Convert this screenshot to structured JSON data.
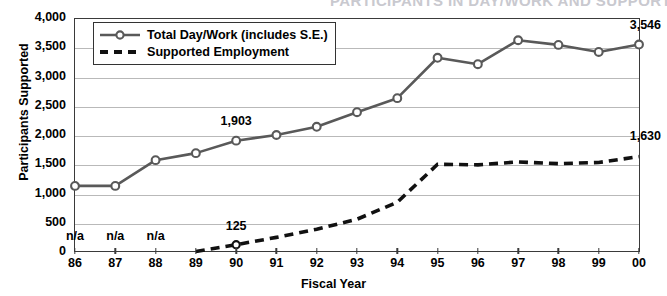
{
  "chart_data": {
    "type": "line",
    "title": "PARTICIPANTS IN DAY/WORK AND SUPPORTED EMPLOYMENT",
    "xlabel": "Fiscal Year",
    "ylabel": "Participants Supported",
    "categories": [
      "86",
      "87",
      "88",
      "89",
      "90",
      "91",
      "92",
      "93",
      "94",
      "95",
      "96",
      "97",
      "98",
      "99",
      "00"
    ],
    "ylim": [
      0,
      4000
    ],
    "ytick_labels": [
      "0",
      "500",
      "1,000",
      "1,500",
      "2,000",
      "2,500",
      "3,000",
      "3,500",
      "4,000"
    ],
    "ytick_values": [
      0,
      500,
      1000,
      1500,
      2000,
      2500,
      3000,
      3500,
      4000
    ],
    "grid": true,
    "legend_position": "top-left",
    "series": [
      {
        "name": "Total Day/Work (includes S.E.)",
        "marker": "open-circle",
        "style": "solid",
        "color": "#595959",
        "values": [
          1130,
          1130,
          1570,
          1690,
          1903,
          2000,
          2140,
          2390,
          2630,
          3320,
          3210,
          3620,
          3540,
          3420,
          3546
        ]
      },
      {
        "name": "Supported Employment",
        "marker": "none",
        "style": "dashed",
        "color": "#111111",
        "values": [
          null,
          null,
          null,
          10,
          125,
          250,
          390,
          560,
          850,
          1500,
          1490,
          1540,
          1510,
          1530,
          1630
        ]
      }
    ],
    "annotations": [
      {
        "text": "n/a",
        "category": "86",
        "value": 250,
        "align": "center"
      },
      {
        "text": "n/a",
        "category": "87",
        "value": 250,
        "align": "center"
      },
      {
        "text": "n/a",
        "category": "88",
        "value": 250,
        "align": "center"
      },
      {
        "text": "125",
        "category": "90",
        "value": 430,
        "align": "center"
      },
      {
        "text": "1,903",
        "category": "90",
        "value": 2230,
        "align": "center"
      },
      {
        "text": "3,546",
        "category": "00",
        "value": 3860,
        "align": "right"
      },
      {
        "text": "1,630",
        "category": "00",
        "value": 1960,
        "align": "right"
      }
    ]
  }
}
